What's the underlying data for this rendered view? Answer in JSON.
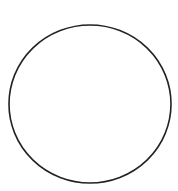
{
  "canvas": {
    "width": 178,
    "height": 191,
    "background": "#ffffff"
  },
  "shapes": [
    {
      "type": "circle",
      "cx": 90,
      "cy": 104,
      "rx": 81,
      "ry": 79,
      "stroke": "#222222",
      "stroke_width": 1.6,
      "fill": "none"
    }
  ]
}
